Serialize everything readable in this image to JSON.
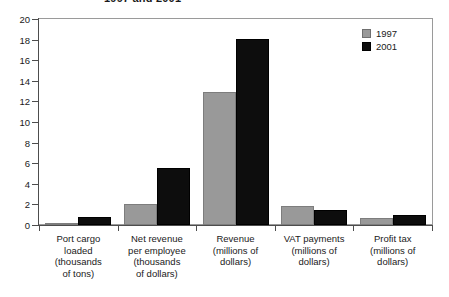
{
  "chart_data": {
    "type": "bar",
    "title": "1997 and 2001",
    "xlabel": "",
    "ylabel": "",
    "ylim": [
      0,
      20
    ],
    "ytick_step": 2,
    "yticks": [
      0,
      2,
      4,
      6,
      8,
      10,
      12,
      14,
      16,
      18,
      20
    ],
    "grid": false,
    "legend_position": "top-right",
    "categories": [
      "Port cargo loaded (thousands of tons)",
      "Net revenue per employee (thousands of dollars)",
      "Revenue (millions of dollars)",
      "VAT payments (millions of dollars)",
      "Profit tax (millions of dollars)"
    ],
    "category_lines": [
      [
        "Port cargo",
        "loaded",
        "(thousands",
        "of tons)"
      ],
      [
        "Net revenue",
        "per employee",
        "(thousands",
        "of dollars)"
      ],
      [
        "Revenue",
        "(millions of",
        "dollars)"
      ],
      [
        "VAT payments",
        "(millions of",
        "dollars)"
      ],
      [
        "Profit tax",
        "(millions of",
        "dollars)"
      ]
    ],
    "series": [
      {
        "name": "1997",
        "color": "#999999",
        "values": [
          0.2,
          2.0,
          12.9,
          1.8,
          0.7
        ]
      },
      {
        "name": "2001",
        "color": "#0d0d0d",
        "values": [
          0.8,
          5.5,
          18.1,
          1.5,
          1.0
        ]
      }
    ]
  },
  "legend": {
    "items": [
      {
        "label": "1997",
        "color": "#999999"
      },
      {
        "label": "2001",
        "color": "#0d0d0d"
      }
    ]
  },
  "colors": {
    "series_1997": "#999999",
    "series_2001": "#0d0d0d",
    "axis": "#4d4d4d",
    "frame": "#9a9a9a",
    "text": "#1a1a1a",
    "background": "#ffffff"
  }
}
